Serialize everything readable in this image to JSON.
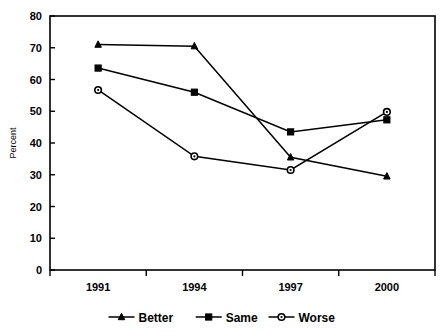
{
  "chart_data": {
    "type": "line",
    "title": "",
    "xlabel": "",
    "ylabel": "Percent",
    "categories": [
      "1991",
      "1994",
      "1997",
      "2000"
    ],
    "ylim": [
      0,
      80
    ],
    "yticks": [
      0,
      10,
      20,
      30,
      40,
      50,
      60,
      70,
      80
    ],
    "ytick_labels": [
      "0",
      "10",
      "20",
      "30",
      "40",
      "50",
      "60",
      "70",
      "80"
    ],
    "grid": false,
    "legend_position": "bottom",
    "series": [
      {
        "name": "Better",
        "marker": "filled-triangle",
        "values": [
          71,
          70.5,
          35.5,
          29.5
        ]
      },
      {
        "name": "Same",
        "marker": "filled-square",
        "values": [
          63.6,
          56,
          43.5,
          47.3
        ]
      },
      {
        "name": "Worse",
        "marker": "open-circle",
        "values": [
          56.7,
          35.8,
          31.5,
          49.8
        ]
      }
    ],
    "colors": {
      "line": "#000000",
      "background": "#ffffff",
      "axis": "#000000"
    }
  },
  "legend": {
    "items": [
      {
        "label": "Better",
        "marker": "filled-triangle"
      },
      {
        "label": "Same",
        "marker": "filled-square"
      },
      {
        "label": "Worse",
        "marker": "open-circle"
      }
    ]
  }
}
